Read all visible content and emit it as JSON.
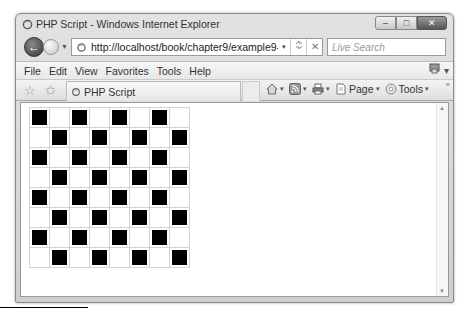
{
  "window": {
    "title": "PHP Script - Windows Internet Explorer",
    "controls": {
      "minimize": "–",
      "maximize": "□",
      "close": "✕"
    }
  },
  "navigation": {
    "back_glyph": "←",
    "history_glyph": "▼",
    "address": {
      "url": "http://localhost/book/chapter9/example9-16.php",
      "dropdown_glyph": "▾",
      "refresh_glyph": "⁴⁺",
      "stop_glyph": "✕"
    },
    "search": {
      "placeholder": "Live Search",
      "search_glyph": "⌕",
      "dropdown_glyph": "▾"
    }
  },
  "menubar": {
    "items": [
      "File",
      "Edit",
      "View",
      "Favorites",
      "Tools",
      "Help"
    ],
    "right_icon_glyph": "▾"
  },
  "commandbar": {
    "favorites_glyph": "☆",
    "add_favorites_glyph": "✩",
    "tab_label": "PHP Script",
    "buttons": [
      {
        "name": "home",
        "label": ""
      },
      {
        "name": "feeds",
        "label": ""
      },
      {
        "name": "print",
        "label": ""
      },
      {
        "name": "page",
        "label": "Page"
      },
      {
        "name": "tools",
        "label": "Tools"
      }
    ],
    "caret": "▾",
    "more_glyph": "»"
  },
  "content": {
    "board": {
      "rows": 8,
      "cols": 8,
      "pattern": "checkerboard",
      "first_cell": "black",
      "dark_color": "#000000",
      "light_color": "#ffffff",
      "grid_color": "#d4d4d4"
    },
    "scrollbar": {
      "up_glyph": "▲",
      "down_glyph": "▼"
    }
  }
}
